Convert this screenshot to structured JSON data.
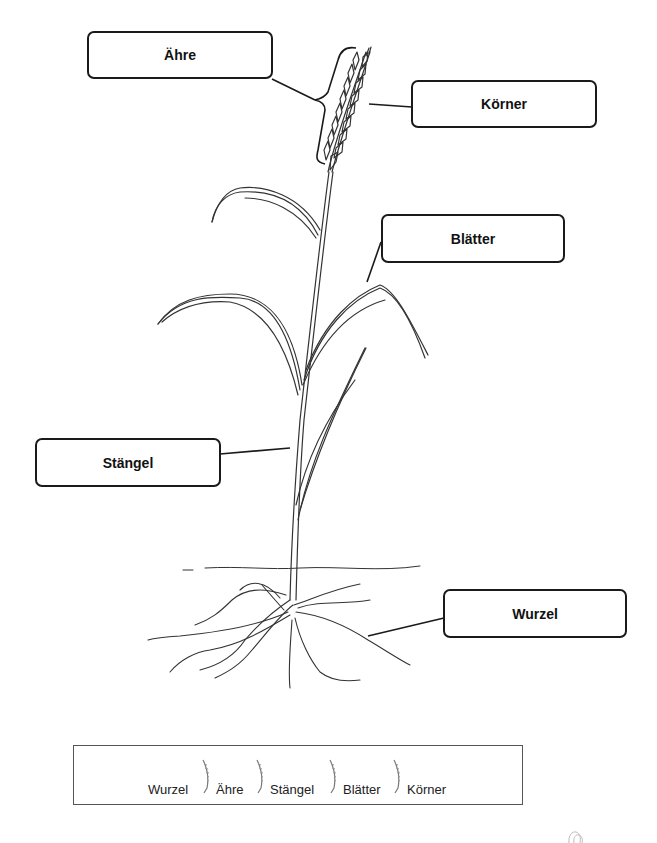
{
  "worksheet": {
    "subject": "Getreidepflanze",
    "labels": [
      {
        "id": "aehre",
        "text": "Ähre"
      },
      {
        "id": "koerner",
        "text": "Körner"
      },
      {
        "id": "blaetter",
        "text": "Blätter"
      },
      {
        "id": "staengel",
        "text": "Stängel"
      },
      {
        "id": "wurzel",
        "text": "Wurzel"
      }
    ],
    "word_bank": {
      "words": [
        "Wurzel",
        "Ähre",
        "Stängel",
        "Blätter",
        "Körner"
      ],
      "separator_icon": "wheat-ear-icon"
    },
    "colors": {
      "line": "#1a1a1a",
      "drawing": "#333333",
      "background": "#ffffff"
    }
  }
}
